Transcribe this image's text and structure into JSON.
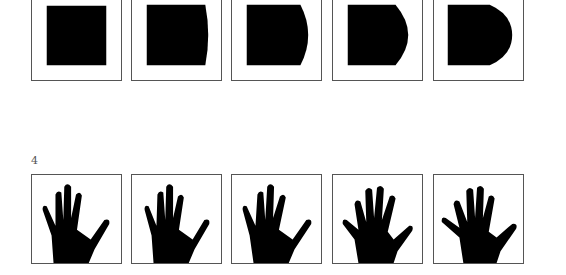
{
  "figure": {
    "top_row": {
      "description": "Square morphing into D-shape (progressively bulging right edge)",
      "items": [
        {
          "id": 1,
          "shape": "square",
          "bulge": 0
        },
        {
          "id": 2,
          "shape": "square-slight-bulge",
          "bulge": 4
        },
        {
          "id": 3,
          "shape": "square-bulge",
          "bulge": 8
        },
        {
          "id": 4,
          "shape": "square-larger-bulge",
          "bulge": 12
        },
        {
          "id": 5,
          "shape": "D-shape",
          "bulge": 16
        }
      ]
    },
    "bottom_row": {
      "label": "4",
      "description": "Sequence of hand silhouettes with spread fingers",
      "items": [
        {
          "id": 1,
          "shape": "hand",
          "variant": "fingers-close"
        },
        {
          "id": 2,
          "shape": "hand",
          "variant": "fingers-close"
        },
        {
          "id": 3,
          "shape": "hand",
          "variant": "fingers-slightly-spread"
        },
        {
          "id": 4,
          "shape": "hand",
          "variant": "fingers-spread"
        },
        {
          "id": 5,
          "shape": "hand",
          "variant": "fingers-wide-spread"
        }
      ]
    },
    "colors": {
      "fill": "#000000",
      "frame": "#555555",
      "background": "#ffffff"
    }
  }
}
